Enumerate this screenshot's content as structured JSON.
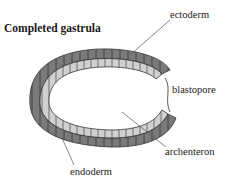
{
  "title": "Completed gastrula",
  "labels": {
    "ectoderm": "ectoderm",
    "blastopore": "blastopore",
    "archenteron": "archenteron",
    "endoderm": "endoderm"
  },
  "colors": {
    "ectoderm": "#7a7a7a",
    "endoderm": "#c8c8c8",
    "outline": "#333333"
  }
}
